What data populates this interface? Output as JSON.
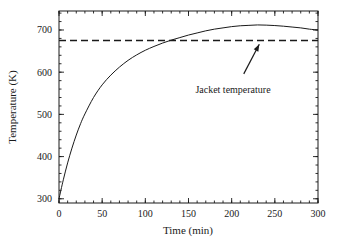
{
  "chart_data": {
    "type": "line",
    "title": "",
    "xlabel": "Time (min)",
    "ylabel": "Temperature (K)",
    "xlim": [
      0,
      300
    ],
    "ylim": [
      290,
      745
    ],
    "grid": false,
    "legend_position": "none",
    "xticks": [
      0,
      50,
      100,
      150,
      200,
      250,
      300
    ],
    "xtick_labels": [
      "0",
      "50",
      "100",
      "150",
      "200",
      "250",
      "300"
    ],
    "xminor_step": 10,
    "yticks": [
      300,
      400,
      500,
      600,
      700
    ],
    "ytick_labels": [
      "300",
      "400",
      "500",
      "600",
      "700"
    ],
    "yminor_step": 20,
    "series": [
      {
        "name": "Reactor temperature",
        "style": "solid",
        "color": "#1a1a1a",
        "x": [
          0,
          5,
          10,
          15,
          20,
          25,
          30,
          40,
          50,
          60,
          70,
          80,
          90,
          100,
          110,
          120,
          130,
          140,
          150,
          160,
          170,
          180,
          190,
          200,
          210,
          220,
          230,
          240,
          250,
          260,
          270,
          280,
          290,
          300
        ],
        "y": [
          300,
          345,
          385,
          420,
          451,
          478,
          501,
          540,
          570,
          593,
          612,
          628,
          641,
          652,
          661,
          669,
          676,
          682,
          688,
          693,
          698,
          702,
          705,
          708,
          710,
          711,
          712,
          711.5,
          710.5,
          709,
          707,
          705,
          702,
          700
        ]
      },
      {
        "name": "Jacket temperature",
        "style": "dashed",
        "color": "#1a1a1a",
        "x": [
          0,
          300
        ],
        "y": [
          675,
          675
        ]
      }
    ],
    "annotations": [
      {
        "text": "Jacket temperature",
        "text_x": 235,
        "text_y": 565,
        "arrow_from_x": 214,
        "arrow_from_y": 596,
        "arrow_to_x": 232,
        "arrow_to_y": 666
      }
    ]
  }
}
